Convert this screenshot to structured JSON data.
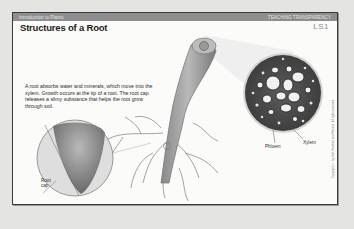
{
  "header": {
    "section": "Introduction to Plants",
    "category": "TEACHING TRANSPARENCY",
    "title": "Structures of a Root",
    "code": "LS1"
  },
  "caption": "A root absorbs water and minerals, which move into the xylem. Growth occurs at the tip of a root. The root cap releases a slimy substance that helps the root grow through soil.",
  "labels": {
    "root_cap": "Root cap",
    "xylem": "Xylem",
    "phloem": "Phloem"
  },
  "copyright": "Copyright © by Holt, Rinehart and Winston. All rights reserved.",
  "colors": {
    "background": "#e4e4e2",
    "sheet": "#fbfbfa",
    "header_bar": "#8e8e8e",
    "border": "#3a3a3a"
  }
}
